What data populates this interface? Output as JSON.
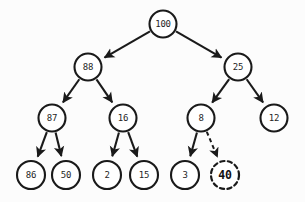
{
  "diagram": {
    "type": "binary-tree",
    "background_color": "#fcfcfc",
    "stroke_color": "#1a1a1a",
    "node_fill": "#ffffff",
    "nodes": [
      {
        "id": "n100",
        "label": "100",
        "cx": 163,
        "cy": 24,
        "r": 13.5,
        "style": "solid",
        "bold": false
      },
      {
        "id": "n88",
        "label": "88",
        "cx": 88,
        "cy": 67,
        "r": 13.5,
        "style": "solid",
        "bold": false
      },
      {
        "id": "n25",
        "label": "25",
        "cx": 238,
        "cy": 67,
        "r": 13.5,
        "style": "solid",
        "bold": false
      },
      {
        "id": "n87",
        "label": "87",
        "cx": 52,
        "cy": 118,
        "r": 13.5,
        "style": "solid",
        "bold": false
      },
      {
        "id": "n16",
        "label": "16",
        "cx": 123,
        "cy": 118,
        "r": 13.5,
        "style": "solid",
        "bold": false
      },
      {
        "id": "n8",
        "label": "8",
        "cx": 201,
        "cy": 118,
        "r": 13.5,
        "style": "solid",
        "bold": false
      },
      {
        "id": "n12",
        "label": "12",
        "cx": 274,
        "cy": 118,
        "r": 13.5,
        "style": "solid",
        "bold": false
      },
      {
        "id": "n86",
        "label": "86",
        "cx": 31,
        "cy": 175,
        "r": 14.0,
        "style": "solid",
        "bold": false
      },
      {
        "id": "n50",
        "label": "50",
        "cx": 66,
        "cy": 175,
        "r": 14.0,
        "style": "solid",
        "bold": false
      },
      {
        "id": "n2",
        "label": "2",
        "cx": 107,
        "cy": 175,
        "r": 14.0,
        "style": "solid",
        "bold": false
      },
      {
        "id": "n15",
        "label": "15",
        "cx": 144,
        "cy": 175,
        "r": 14.0,
        "style": "solid",
        "bold": false
      },
      {
        "id": "n3",
        "label": "3",
        "cx": 185,
        "cy": 175,
        "r": 14.0,
        "style": "solid",
        "bold": false
      },
      {
        "id": "n40",
        "label": "40",
        "cx": 225,
        "cy": 175,
        "r": 14.0,
        "style": "dashed",
        "bold": true
      }
    ],
    "edges": [
      {
        "id": "e-100-88",
        "from": "n100",
        "to": "n88",
        "style": "solid",
        "arrow": true
      },
      {
        "id": "e-100-25",
        "from": "n100",
        "to": "n25",
        "style": "solid",
        "arrow": true
      },
      {
        "id": "e-88-87",
        "from": "n88",
        "to": "n87",
        "style": "solid",
        "arrow": true
      },
      {
        "id": "e-88-16",
        "from": "n88",
        "to": "n16",
        "style": "solid",
        "arrow": true
      },
      {
        "id": "e-25-8",
        "from": "n25",
        "to": "n8",
        "style": "solid",
        "arrow": true
      },
      {
        "id": "e-25-12",
        "from": "n25",
        "to": "n12",
        "style": "solid",
        "arrow": true
      },
      {
        "id": "e-87-86",
        "from": "n87",
        "to": "n86",
        "style": "solid",
        "arrow": true
      },
      {
        "id": "e-87-50",
        "from": "n87",
        "to": "n50",
        "style": "solid",
        "arrow": true
      },
      {
        "id": "e-16-2",
        "from": "n16",
        "to": "n2",
        "style": "solid",
        "arrow": true
      },
      {
        "id": "e-16-15",
        "from": "n16",
        "to": "n15",
        "style": "solid",
        "arrow": true
      },
      {
        "id": "e-8-3",
        "from": "n8",
        "to": "n3",
        "style": "solid",
        "arrow": true
      },
      {
        "id": "e-8-40",
        "from": "n8",
        "to": "n40",
        "style": "dashed",
        "arrow": true
      }
    ]
  }
}
